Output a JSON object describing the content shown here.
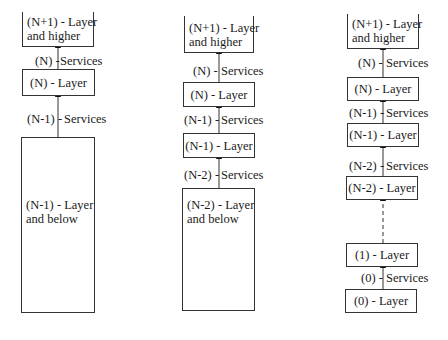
{
  "diagram": {
    "columns": [
      {
        "boxes": [
          {
            "line1": "(N+1) -  Layer",
            "line2": "and  higher"
          },
          {
            "line1": "(N) -  Layer"
          },
          {
            "line1": "(N-1) -  Layer",
            "line2": "and  below"
          }
        ],
        "services": [
          {
            "prefix": "(N) -",
            "label": "Services"
          },
          {
            "prefix": "(N-1) -",
            "label": "Services"
          }
        ]
      },
      {
        "boxes": [
          {
            "line1": "(N+1) -  Layer",
            "line2": "and  higher"
          },
          {
            "line1": "(N) -  Layer"
          },
          {
            "line1": "(N-1) -  Layer"
          },
          {
            "line1": "(N-2) -  Layer",
            "line2": "and  below"
          }
        ],
        "services": [
          {
            "prefix": "(N) -",
            "label": "Services"
          },
          {
            "prefix": "(N-1) -",
            "label": "Services"
          },
          {
            "prefix": "(N-2) -",
            "label": "Services"
          }
        ]
      },
      {
        "boxes": [
          {
            "line1": "(N+1) -  Layer",
            "line2": "and  higher"
          },
          {
            "line1": "(N) -  Layer"
          },
          {
            "line1": "(N-1) -  Layer"
          },
          {
            "line1": "(N-2) -  Layer"
          },
          {
            "line1": "(1) -  Layer"
          },
          {
            "line1": "(0) -  Layer"
          }
        ],
        "services": [
          {
            "prefix": "(N) -",
            "label": "Services"
          },
          {
            "prefix": "(N-1) -",
            "label": "Services"
          },
          {
            "prefix": "(N-2) -",
            "label": "Services"
          },
          {
            "prefix": "(0) -",
            "label": "Services"
          }
        ]
      }
    ]
  }
}
